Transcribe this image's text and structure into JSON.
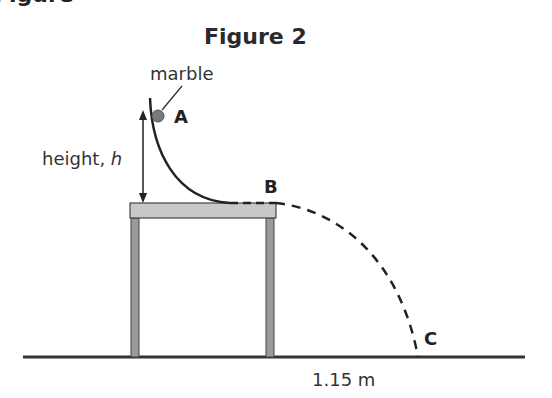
{
  "partial_heading": "Figure",
  "title": "Figure 2",
  "labels": {
    "marble": "marble",
    "height_prefix": "height, ",
    "height_var": "h",
    "distance": "1.15 m"
  },
  "points": {
    "a": "A",
    "b": "B",
    "c": "C"
  },
  "colors": {
    "table_top": "#c8c8c8",
    "table_legs": "#9a9a9a",
    "marble": "#7a7a7a",
    "line": "#2a2a2a"
  }
}
